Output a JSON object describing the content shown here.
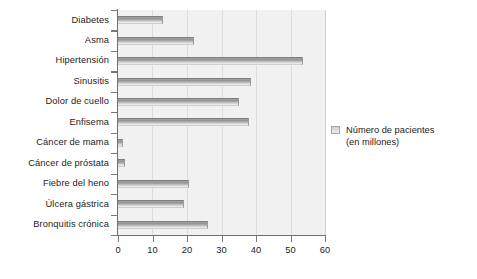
{
  "chart_data": {
    "type": "bar",
    "orientation": "horizontal",
    "title": "",
    "xlabel": "",
    "ylabel": "",
    "xlim": [
      0,
      60
    ],
    "xticks": [
      0,
      10,
      20,
      30,
      40,
      50,
      60
    ],
    "grid": true,
    "legend_position": "right",
    "categories": [
      "Diabetes",
      "Asma",
      "Hipertensión",
      "Sinusitis",
      "Dolor de cuello",
      "Enfisema",
      "Cáncer de mama",
      "Cáncer de próstata",
      "Fiebre del heno",
      "Úlcera gástrica",
      "Bronquitis crónica"
    ],
    "series": [
      {
        "name": "Número de pacientes\n(en millones)",
        "values": [
          13,
          22,
          53.5,
          38.5,
          35,
          38,
          1.5,
          2,
          20.5,
          19,
          26
        ]
      }
    ]
  },
  "legend": {
    "label": "Número de pacientes\n(en millones)",
    "swatch_name": "legend-swatch"
  },
  "colors": {
    "plot_background": "#f1f1f1",
    "gridline": "#dcdcdc",
    "axis": "#6f6f6f",
    "bar_dark": "#8f8f8f",
    "bar_light": "#efefef",
    "text": "#1c1c1c",
    "page_background": "#ffffff"
  }
}
